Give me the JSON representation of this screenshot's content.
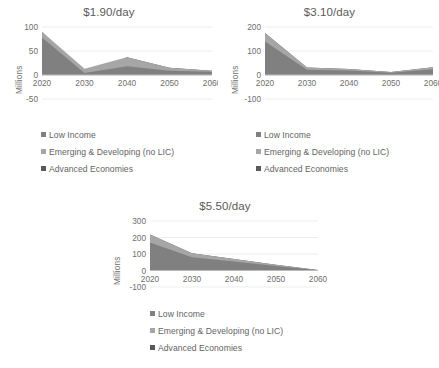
{
  "figure": {
    "background": "#ffffff",
    "series_colors": [
      "#808080",
      "#a6a6a6",
      "#595959"
    ],
    "series_names": [
      "Low Income",
      "Emerging & Developing (no LIC)",
      "Advanced Economies"
    ],
    "legend_labels": {
      "low_income": "Low Income",
      "emerging": "Emerging & Developing (no LIC)",
      "advanced": "Advanced Economies"
    }
  },
  "chart_data": [
    {
      "type": "area",
      "stacked": true,
      "title": "$1.90/day",
      "xlabel": "",
      "ylabel": "Millions",
      "x": [
        2020,
        2030,
        2040,
        2050,
        2060
      ],
      "xticks": [
        "2020",
        "2030",
        "2040",
        "2050",
        "2060"
      ],
      "yticks": [
        "100",
        "50",
        "0",
        "-50"
      ],
      "ylim": [
        -50,
        100
      ],
      "xlim": [
        2020,
        2060
      ],
      "grid": true,
      "legend_position": "below",
      "series": [
        {
          "name": "Low Income",
          "values": [
            78,
            4,
            18,
            9,
            7
          ]
        },
        {
          "name": "Emerging & Developing (no LIC)",
          "values": [
            12,
            9,
            19,
            6,
            2
          ]
        },
        {
          "name": "Advanced Economies",
          "values": [
            0,
            -13,
            0,
            0,
            0
          ]
        }
      ],
      "series_totals": [
        90,
        13,
        37,
        15,
        9
      ]
    },
    {
      "type": "area",
      "stacked": true,
      "title": "$3.10/day",
      "xlabel": "",
      "ylabel": "Millions",
      "x": [
        2020,
        2030,
        2040,
        2050,
        2060
      ],
      "xticks": [
        "2020",
        "2030",
        "2040",
        "2050",
        "2060"
      ],
      "yticks": [
        "200",
        "100",
        "0",
        "-100"
      ],
      "ylim": [
        -100,
        200
      ],
      "xlim": [
        2020,
        2060
      ],
      "grid": true,
      "legend_position": "below",
      "series": [
        {
          "name": "Low Income",
          "values": [
            140,
            22,
            19,
            9,
            24
          ]
        },
        {
          "name": "Emerging & Developing (no LIC)",
          "values": [
            35,
            9,
            6,
            3,
            8
          ]
        },
        {
          "name": "Advanced Economies",
          "values": [
            0,
            0,
            0,
            0,
            0
          ]
        }
      ],
      "series_totals": [
        175,
        31,
        25,
        12,
        32
      ]
    },
    {
      "type": "area",
      "stacked": true,
      "title": "$5.50/day",
      "xlabel": "",
      "ylabel": "Millions",
      "x": [
        2020,
        2030,
        2040,
        2050,
        2060
      ],
      "xticks": [
        "2020",
        "2030",
        "2040",
        "2050",
        "2060"
      ],
      "yticks": [
        "300",
        "200",
        "100",
        "0",
        "-100"
      ],
      "ylim": [
        -100,
        300
      ],
      "xlim": [
        2020,
        2060
      ],
      "grid": true,
      "legend_position": "below",
      "series": [
        {
          "name": "Low Income",
          "values": [
            170,
            80,
            55,
            28,
            2
          ]
        },
        {
          "name": "Emerging & Developing (no LIC)",
          "values": [
            48,
            25,
            15,
            7,
            1
          ]
        },
        {
          "name": "Advanced Economies",
          "values": [
            0,
            0,
            0,
            0,
            0
          ]
        }
      ],
      "series_totals": [
        218,
        105,
        70,
        35,
        3
      ]
    }
  ]
}
